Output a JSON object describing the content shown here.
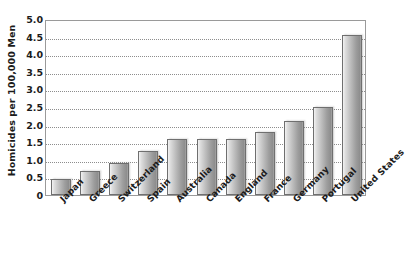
{
  "chart_data": {
    "type": "bar",
    "title": "",
    "subtitle": "",
    "xlabel": "",
    "ylabel": "Homicides per 100,000 Men",
    "categories": [
      "Japan",
      "Greece",
      "Switzerland",
      "Spain",
      "Australia",
      "Canada",
      "England",
      "France",
      "Germany",
      "Portugal",
      "United States"
    ],
    "values": [
      0.45,
      0.68,
      0.92,
      1.25,
      1.6,
      1.6,
      1.6,
      1.78,
      2.1,
      2.5,
      4.55
    ],
    "ylim": [
      0,
      5.0
    ],
    "ytick_values": [
      0,
      0.5,
      1.0,
      1.5,
      2.0,
      2.5,
      3.0,
      3.5,
      4.0,
      4.5,
      5.0
    ],
    "ytick_labels": [
      "0",
      "0.5",
      "1.0",
      "1.5",
      "2.0",
      "2.5",
      "3.0",
      "3.5",
      "4.0",
      "4.5",
      "5.0"
    ],
    "grid": true,
    "grid_style": "dotted",
    "legend": false,
    "legend_position": "none",
    "bar_color": "#b0b0b0",
    "bar_edge_color": "#6f6f6f",
    "axis_color": "#9a9a9a",
    "text_color": "#1b1b1b",
    "background_color": "#ffffff",
    "xtick_label_rotation": -45
  }
}
